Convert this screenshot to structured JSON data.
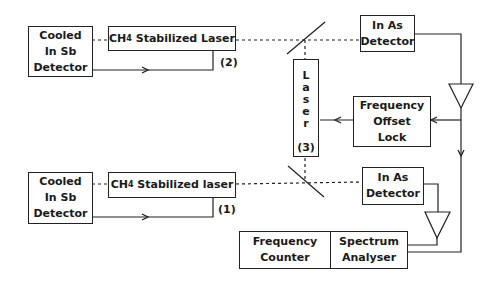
{
  "diagram": {
    "blocks": {
      "detector_top": {
        "lines": [
          "Cooled",
          "In Sb",
          "Detector"
        ]
      },
      "laser2": {
        "prefix": "CH",
        "sub": "4",
        "suffix": " Stabilized Laser",
        "tag": "(2)"
      },
      "inas_top": {
        "lines": [
          "In As",
          "Detector"
        ]
      },
      "laser3": {
        "letters": [
          "L",
          "a",
          "s",
          "e",
          "r"
        ],
        "tag": "(3)"
      },
      "offset_lock": {
        "lines": [
          "Frequency",
          "Offset",
          "Lock"
        ]
      },
      "detector_bottom": {
        "lines": [
          "Cooled",
          "In Sb",
          "Detector"
        ]
      },
      "laser1": {
        "prefix": "CH",
        "sub": "4",
        "suffix": " Stabilized laser",
        "tag": "(1)"
      },
      "inas_bottom": {
        "lines": [
          "In As",
          "Detector"
        ]
      },
      "freq_counter": {
        "lines": [
          "Frequency",
          "Counter"
        ]
      },
      "spectrum": {
        "lines": [
          "Spectrum",
          "Analyser"
        ]
      }
    }
  }
}
